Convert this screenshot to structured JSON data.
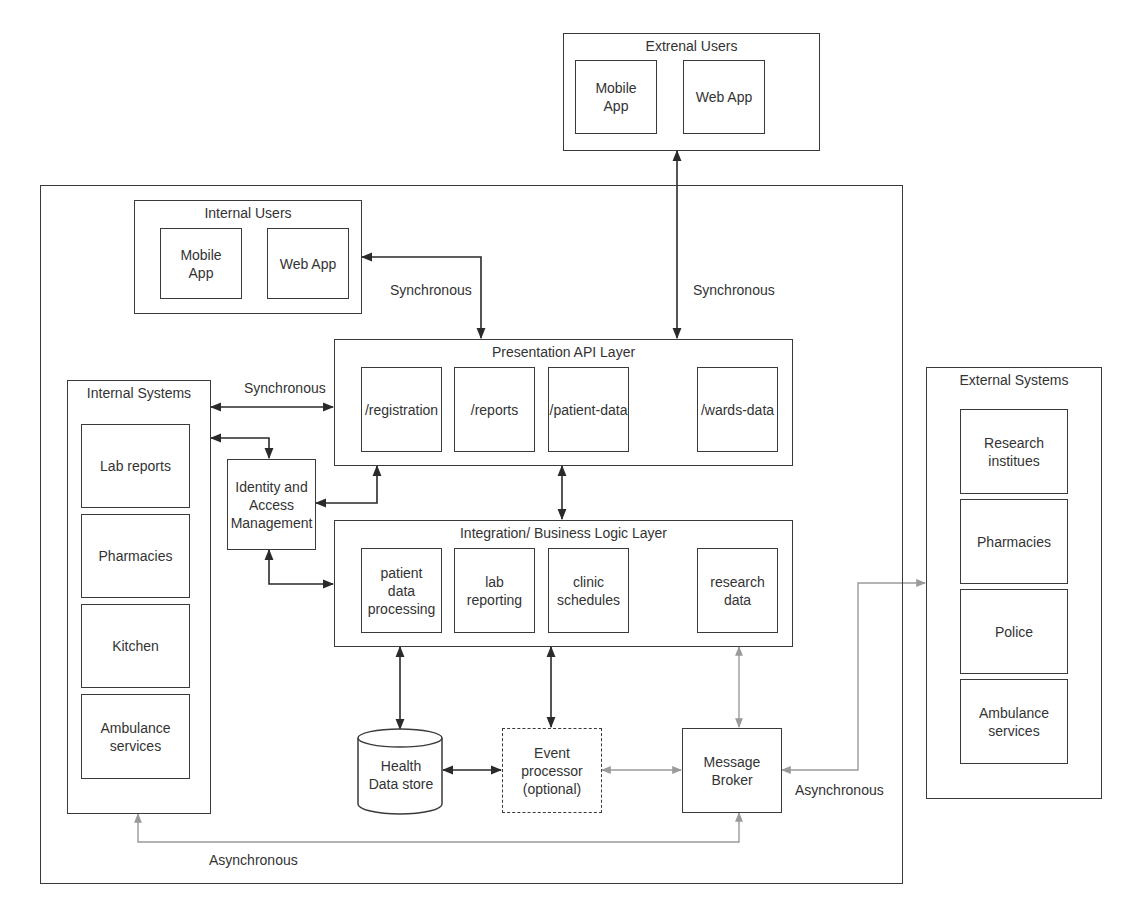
{
  "external_users": {
    "title": "Extrenal Users",
    "items": [
      {
        "label": "Mobile\nApp"
      },
      {
        "label": "Web App"
      }
    ]
  },
  "internal_users": {
    "title": "Internal Users",
    "items": [
      {
        "label": "Mobile\nApp"
      },
      {
        "label": "Web App"
      }
    ]
  },
  "presentation_layer": {
    "title": "Presentation API Layer",
    "items": [
      {
        "label": "/registration"
      },
      {
        "label": "/reports"
      },
      {
        "label": "/patient-data"
      },
      {
        "label": "/wards-data"
      }
    ]
  },
  "integration_layer": {
    "title": "Integration/ Business Logic Layer",
    "items": [
      {
        "label": "patient\ndata\nprocessing"
      },
      {
        "label": "lab\nreporting"
      },
      {
        "label": "clinic\nschedules"
      },
      {
        "label": "research\ndata"
      }
    ]
  },
  "internal_systems": {
    "title": "Internal Systems",
    "items": [
      {
        "label": "Lab reports"
      },
      {
        "label": "Pharmacies"
      },
      {
        "label": "Kitchen"
      },
      {
        "label": "Ambulance\nservices"
      }
    ]
  },
  "external_systems": {
    "title": "External Systems",
    "items": [
      {
        "label": "Research\ninstitues"
      },
      {
        "label": "Pharmacies"
      },
      {
        "label": "Police"
      },
      {
        "label": "Ambulance\nservices"
      }
    ]
  },
  "iam": {
    "label": "Identity and\nAccess\nManagement"
  },
  "health_data_store": {
    "label": "Health\nData store"
  },
  "event_processor": {
    "label": "Event\nprocessor\n(optional)"
  },
  "message_broker": {
    "label": "Message\nBroker"
  },
  "connector_labels": {
    "internal_users_sync": "Synchronous",
    "external_users_sync": "Synchronous",
    "internal_systems_sync": "Synchronous",
    "external_systems_async": "Asynchronous",
    "internal_systems_async": "Asynchronous"
  },
  "colors": {
    "line_sync": "#2a2a2a",
    "line_async": "#9a9a9a",
    "border": "#3a3a3a"
  }
}
